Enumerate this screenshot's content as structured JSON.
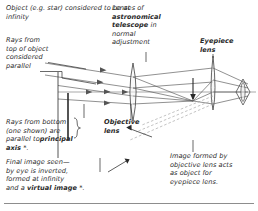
{
  "diagram": {
    "ink_color": "#2a2a2a",
    "ray_color": "#555555",
    "dashed_color": "#9a9a9a",
    "annotations": {
      "object_at_infinity": "Object (e.g. star) considered to be at infinity",
      "rays_from_top": "Rays from\ntop of object\nconsidered\nparallel",
      "rays_from_bottom_pre": "Rays from bottom\n(one shown) are\nparallel to",
      "rays_from_bottom_bold": "principal axis",
      "rays_from_bottom_post": " *.",
      "final_image_pre": "Final image seen—\nby eye is inverted,\nformed at infinity\nand a ",
      "final_image_bold": "virtual image",
      "final_image_post": " *.",
      "lenses_pre": "Lenses of\n",
      "lenses_bold": "astronomical\ntelescope",
      "lenses_post": " in\nnormal\nadjustment",
      "objective_lens": "Objective\nlens",
      "eyepiece_lens": "Eyepiece\nlens",
      "image_formed": "Image formed by\nobjective lens acts\nas object for\neyepiece lens."
    },
    "optics": {
      "objective_lens_x": 133,
      "eyepiece_lens_x": 213,
      "principal_axis_y": 92,
      "intermediate_image_x": 193,
      "eye_x": 243,
      "eye_y": 90
    }
  }
}
